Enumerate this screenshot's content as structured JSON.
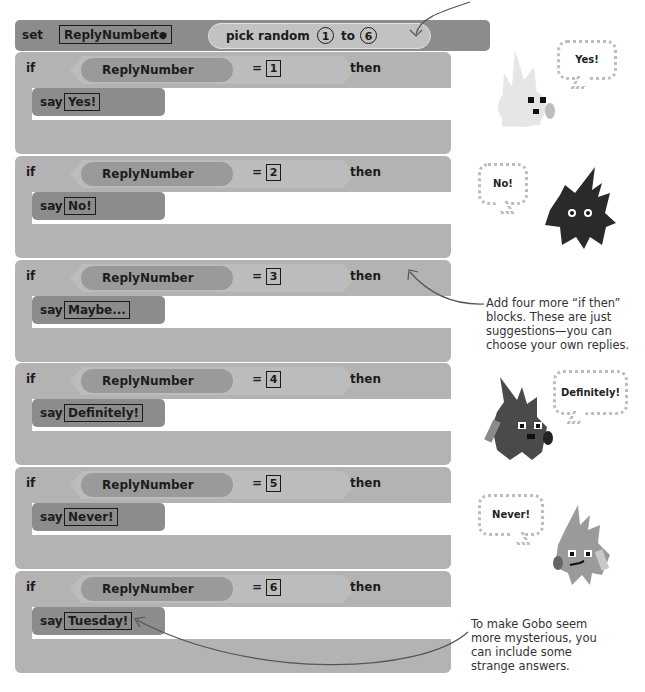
{
  "set_block": {
    "keyword": "set",
    "variable": "ReplyNumber",
    "dropdown_arrow": "▼",
    "to_label": "to",
    "pick_random_label": "pick random",
    "from_value": "1",
    "to_word": "to",
    "to_value": "6"
  },
  "if_blocks": [
    {
      "if_label": "if",
      "variable": "ReplyNumber",
      "operator": "=",
      "value": "1",
      "then_label": "then",
      "say_label": "say",
      "reply": "Yes!"
    },
    {
      "if_label": "if",
      "variable": "ReplyNumber",
      "operator": "=",
      "value": "2",
      "then_label": "then",
      "say_label": "say",
      "reply": "No!"
    },
    {
      "if_label": "if",
      "variable": "ReplyNumber",
      "operator": "=",
      "value": "3",
      "then_label": "then",
      "say_label": "say",
      "reply": "Maybe..."
    },
    {
      "if_label": "if",
      "variable": "ReplyNumber",
      "operator": "=",
      "value": "4",
      "then_label": "then",
      "say_label": "say",
      "reply": "Definitely!"
    },
    {
      "if_label": "if",
      "variable": "ReplyNumber",
      "operator": "=",
      "value": "5",
      "then_label": "then",
      "say_label": "say",
      "reply": "Never!"
    },
    {
      "if_label": "if",
      "variable": "ReplyNumber",
      "operator": "=",
      "value": "6",
      "then_label": "then",
      "say_label": "say",
      "reply": "Tuesday!"
    }
  ],
  "characters": [
    {
      "bubble": "Yes!",
      "body_color": "#e8e8e8"
    },
    {
      "bubble": "No!",
      "body_color": "#2a2a2a"
    },
    {
      "bubble": "Definitely!",
      "body_color": "#4a4a4a"
    },
    {
      "bubble": "Never!",
      "body_color": "#9a9a9a"
    }
  ],
  "annotations": {
    "add_more": "Add four more “if then” blocks. These are just suggestions—you can choose your own replies.",
    "strange_answers": "To make Gobo seem more mysterious, you can include some strange answers."
  }
}
